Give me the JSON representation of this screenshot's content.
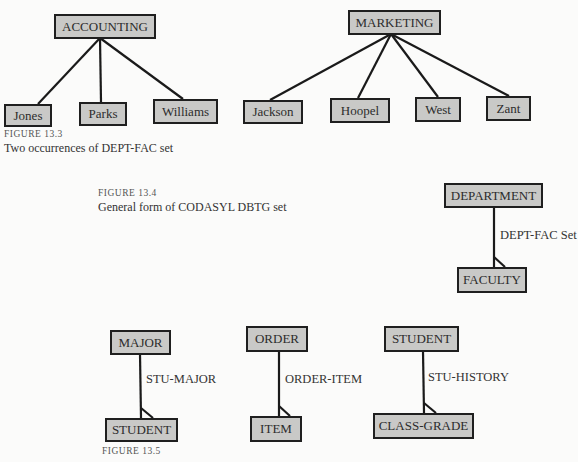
{
  "figure_13_3": {
    "number": "FIGURE 13.3",
    "caption": "Two occurrences of DEPT-FAC set",
    "trees": [
      {
        "owner": "ACCOUNTING",
        "members": [
          "Jones",
          "Parks",
          "Williams"
        ]
      },
      {
        "owner": "MARKETING",
        "members": [
          "Jackson",
          "Hoopel",
          "West",
          "Zant"
        ]
      }
    ]
  },
  "figure_13_4": {
    "number": "FIGURE 13.4",
    "caption": "General form of CODASYL DBTG set",
    "owner": "DEPARTMENT",
    "set_name": "DEPT-FAC Set",
    "member": "FACULTY"
  },
  "figure_13_5": {
    "number": "FIGURE 13.5",
    "sets": [
      {
        "owner": "MAJOR",
        "set_name": "STU-MAJOR",
        "member": "STUDENT"
      },
      {
        "owner": "ORDER",
        "set_name": "ORDER-ITEM",
        "member": "ITEM"
      },
      {
        "owner": "STUDENT",
        "set_name": "STU-HISTORY",
        "member": "CLASS-GRADE"
      }
    ]
  }
}
